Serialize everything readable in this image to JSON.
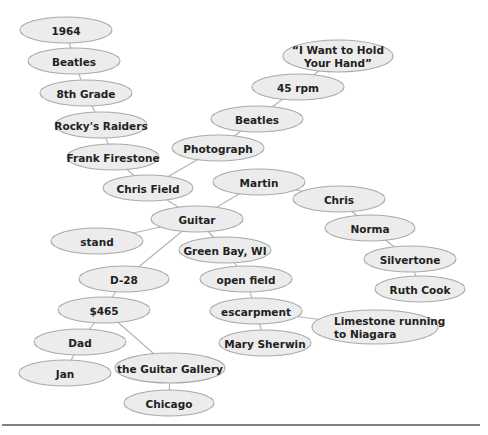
{
  "diagram": {
    "type": "cluster-map",
    "colors": {
      "node_fill": "#ececec",
      "node_stroke": "#a9a9a9",
      "edge": "#b5b5b5",
      "text": "#222222",
      "rule": "#555555"
    },
    "nodes": [
      {
        "id": "n1964",
        "label": "1964",
        "cx": 66,
        "cy": 30,
        "rx": 46,
        "ry": 13
      },
      {
        "id": "beatlesL",
        "label": "Beatles",
        "cx": 74,
        "cy": 61,
        "rx": 46,
        "ry": 13
      },
      {
        "id": "grade8",
        "label": "8th Grade",
        "cx": 86,
        "cy": 93,
        "rx": 46,
        "ry": 13
      },
      {
        "id": "rocky",
        "label": "Rocky's Raiders",
        "cx": 101,
        "cy": 125,
        "rx": 46,
        "ry": 13
      },
      {
        "id": "frank",
        "label": "Frank Firestone",
        "cx": 113,
        "cy": 157,
        "rx": 46,
        "ry": 13
      },
      {
        "id": "chrisfield",
        "label": "Chris Field",
        "cx": 148,
        "cy": 188,
        "rx": 45,
        "ry": 13
      },
      {
        "id": "guitar",
        "label": "Guitar",
        "cx": 197,
        "cy": 219,
        "rx": 46,
        "ry": 13
      },
      {
        "id": "photo",
        "label": "Photograph",
        "cx": 218,
        "cy": 148,
        "rx": 46,
        "ry": 13
      },
      {
        "id": "beatlesR",
        "label": "Beatles",
        "cx": 257,
        "cy": 119,
        "rx": 46,
        "ry": 13
      },
      {
        "id": "rpm",
        "label": "45 rpm",
        "cx": 298,
        "cy": 87,
        "rx": 46,
        "ry": 13
      },
      {
        "id": "song",
        "label": "“I Want to Hold",
        "label2": "Your Hand”",
        "cx": 338,
        "cy": 56,
        "rx": 55,
        "ry": 16
      },
      {
        "id": "martin",
        "label": "Martin",
        "cx": 259,
        "cy": 182,
        "rx": 46,
        "ry": 13
      },
      {
        "id": "chris",
        "label": "Chris",
        "cx": 339,
        "cy": 199,
        "rx": 46,
        "ry": 13
      },
      {
        "id": "norma",
        "label": "Norma",
        "cx": 370,
        "cy": 228,
        "rx": 45,
        "ry": 13
      },
      {
        "id": "silvertone",
        "label": "Silvertone",
        "cx": 410,
        "cy": 259,
        "rx": 46,
        "ry": 13
      },
      {
        "id": "ruth",
        "label": "Ruth Cook",
        "cx": 420,
        "cy": 289,
        "rx": 45,
        "ry": 13
      },
      {
        "id": "stand",
        "label": "stand",
        "cx": 97,
        "cy": 241,
        "rx": 46,
        "ry": 13
      },
      {
        "id": "greenbay",
        "label": "Green Bay, WI",
        "cx": 225,
        "cy": 250,
        "rx": 46,
        "ry": 13
      },
      {
        "id": "openfield",
        "label": "open field",
        "cx": 246,
        "cy": 279,
        "rx": 46,
        "ry": 13
      },
      {
        "id": "escarpment",
        "label": "escarpment",
        "cx": 256,
        "cy": 311,
        "rx": 46,
        "ry": 13
      },
      {
        "id": "limestone",
        "label": "Limestone running",
        "label2": "to Niagara",
        "cx": 375,
        "cy": 327,
        "rx": 63,
        "ry": 17
      },
      {
        "id": "mary",
        "label": "Mary Sherwin",
        "cx": 265,
        "cy": 343,
        "rx": 46,
        "ry": 13
      },
      {
        "id": "d28",
        "label": "D-28",
        "cx": 124,
        "cy": 279,
        "rx": 45,
        "ry": 13
      },
      {
        "id": "price",
        "label": "$465",
        "cx": 104,
        "cy": 310,
        "rx": 46,
        "ry": 13
      },
      {
        "id": "dad",
        "label": "Dad",
        "cx": 80,
        "cy": 342,
        "rx": 46,
        "ry": 13
      },
      {
        "id": "jan",
        "label": "Jan",
        "cx": 65,
        "cy": 373,
        "rx": 46,
        "ry": 13
      },
      {
        "id": "gallery",
        "label": "the Guitar Gallery",
        "cx": 170,
        "cy": 368,
        "rx": 55,
        "ry": 15
      },
      {
        "id": "chicago",
        "label": "Chicago",
        "cx": 169,
        "cy": 403,
        "rx": 45,
        "ry": 13
      }
    ],
    "edges": [
      [
        "n1964",
        "beatlesL"
      ],
      [
        "beatlesL",
        "grade8"
      ],
      [
        "grade8",
        "rocky"
      ],
      [
        "rocky",
        "frank"
      ],
      [
        "frank",
        "chrisfield"
      ],
      [
        "chrisfield",
        "photo"
      ],
      [
        "photo",
        "beatlesR"
      ],
      [
        "beatlesR",
        "rpm"
      ],
      [
        "rpm",
        "song"
      ],
      [
        "chrisfield",
        "guitar"
      ],
      [
        "guitar",
        "martin"
      ],
      [
        "martin",
        "chris"
      ],
      [
        "chris",
        "norma"
      ],
      [
        "norma",
        "silvertone"
      ],
      [
        "silvertone",
        "ruth"
      ],
      [
        "guitar",
        "stand"
      ],
      [
        "guitar",
        "greenbay"
      ],
      [
        "greenbay",
        "openfield"
      ],
      [
        "openfield",
        "escarpment"
      ],
      [
        "escarpment",
        "limestone"
      ],
      [
        "escarpment",
        "mary"
      ],
      [
        "guitar",
        "d28"
      ],
      [
        "d28",
        "price"
      ],
      [
        "price",
        "dad"
      ],
      [
        "dad",
        "jan"
      ],
      [
        "price",
        "gallery"
      ],
      [
        "gallery",
        "chicago"
      ]
    ],
    "rule": {
      "x1": 2,
      "x2": 480,
      "y": 425
    }
  }
}
